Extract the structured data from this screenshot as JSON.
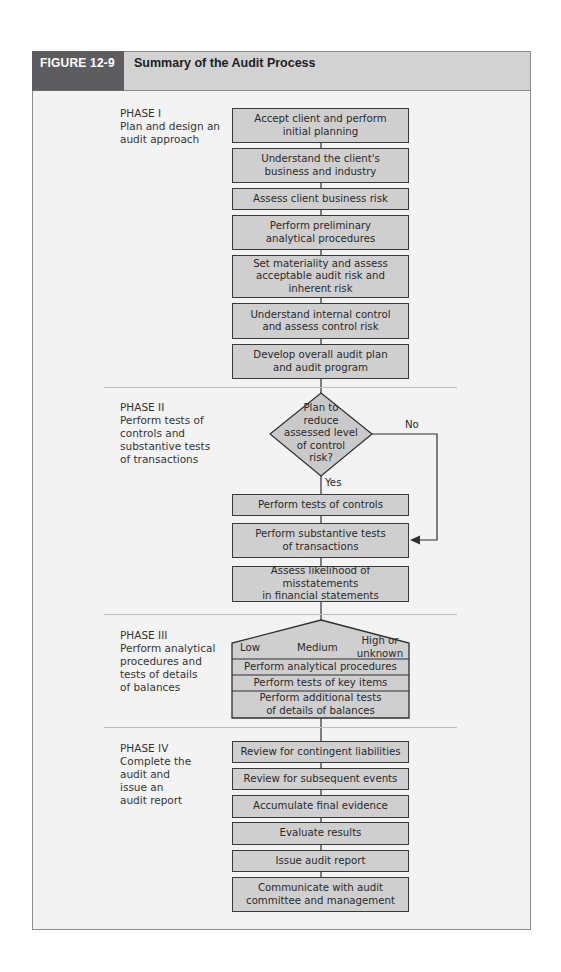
{
  "figure": {
    "number": "FIGURE 12-9",
    "title": "Summary of the Audit Process"
  },
  "phases": [
    {
      "label": "PHASE I\nPlan and design an\naudit approach",
      "steps": [
        "Accept client and perform\ninitial planning",
        "Understand the client's\nbusiness and industry",
        "Assess client business risk",
        "Perform preliminary\nanalytical procedures",
        "Set materiality and assess\nacceptable audit risk and\ninherent risk",
        "Understand internal control\nand assess control risk",
        "Develop overall audit plan\nand audit program"
      ]
    },
    {
      "label": "PHASE II\nPerform tests of\ncontrols and\nsubstantive tests\nof transactions",
      "decision": {
        "question": "Plan to\nreduce\nassessed level\nof control\nrisk?",
        "yes_label": "Yes",
        "no_label": "No"
      },
      "steps": [
        "Perform tests of controls",
        "Perform substantive tests\nof transactions",
        "Assess likelihood of misstatements\nin financial statements"
      ]
    },
    {
      "label": "PHASE III\nPerform analytical\nprocedures and\ntests of details\nof balances",
      "levels": [
        "Low",
        "Medium",
        "High or\nunknown"
      ],
      "steps": [
        "Perform analytical procedures",
        "Perform tests of key items",
        "Perform additional tests\nof details of balances"
      ]
    },
    {
      "label": "PHASE IV\nComplete the\naudit and\nissue an\naudit report",
      "steps": [
        "Review for contingent liabilities",
        "Review for subsequent events",
        "Accumulate final evidence",
        "Evaluate results",
        "Issue audit report",
        "Communicate with audit\ncommittee and management"
      ]
    }
  ],
  "colors": {
    "header_dark": "#5d5d5f",
    "header_light": "#d2d2d2",
    "box_fill": "#cfcfcf",
    "panel_bg": "#f3f3f3",
    "line": "#2f2f2f"
  }
}
